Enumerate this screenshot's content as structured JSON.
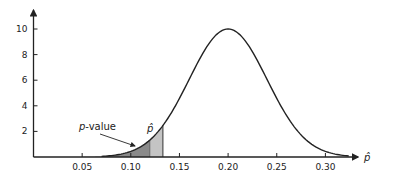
{
  "chart_data": {
    "type": "line",
    "title": "",
    "xlabel": "p̂",
    "ylabel": "",
    "x_ticks": [
      "0.05",
      "0.10",
      "0.15",
      "0.20",
      "0.25",
      "0.30"
    ],
    "y_ticks": [
      "2",
      "4",
      "6",
      "8",
      "10"
    ],
    "xlim": [
      0,
      0.33
    ],
    "ylim": [
      0,
      10.5
    ],
    "series": [
      {
        "name": "Sampling distribution of p̂ (Normal, mean 0.20, sd 0.04)",
        "mean": 0.2,
        "sd": 0.04,
        "peak": 10
      }
    ],
    "shaded_regions": [
      {
        "name": "p-value",
        "from": 0.0,
        "to": 0.12,
        "shade": "dark"
      },
      {
        "name": "p̂ band",
        "from": 0.12,
        "to": 0.133,
        "shade": "light"
      }
    ],
    "annotations": [
      {
        "text": "p-value",
        "points_to": 0.118
      },
      {
        "text": "p̂",
        "at": 0.12
      }
    ]
  },
  "labels": {
    "pvalue": "-value",
    "pvalue_italic": "p",
    "phat": "p̂",
    "xaxis": "p̂"
  }
}
